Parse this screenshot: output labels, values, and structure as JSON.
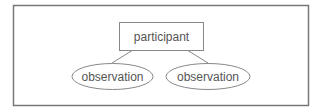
{
  "diagram": {
    "root": {
      "label": "participant"
    },
    "children": [
      {
        "label": "observation"
      },
      {
        "label": "observation"
      }
    ],
    "colors": {
      "stroke": "#7a7a7a",
      "text": "#555555",
      "background": "#ffffff"
    }
  }
}
